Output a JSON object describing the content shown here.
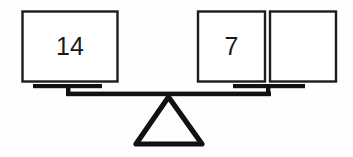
{
  "diagram": {
    "type": "balance-scale",
    "state": "balanced",
    "colors": {
      "ink": "#111111",
      "box_stroke": "#1c1c1c",
      "box_fill": "#ffffff",
      "background": "#fefefe"
    },
    "left_pan": {
      "name": "left-pan",
      "boxes": [
        {
          "label": "14",
          "empty": false
        }
      ]
    },
    "right_pan": {
      "name": "right-pan",
      "boxes": [
        {
          "label": "7",
          "empty": false
        },
        {
          "label": "",
          "empty": true
        }
      ]
    },
    "fulcrum": {
      "shape": "triangle",
      "label": ""
    }
  }
}
